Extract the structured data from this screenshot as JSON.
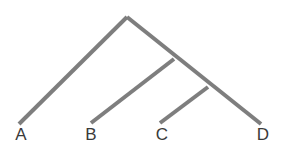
{
  "figure": {
    "kind": "cladogram",
    "title": "",
    "background_color": "#ffffff",
    "branch_color": "#7e7e7e",
    "branch_width": 4,
    "label_color": "#3a3a3a"
  },
  "chart_data": {
    "type": "diagram",
    "subtype": "cladogram",
    "title": "",
    "xlabel": "",
    "ylabel": "",
    "taxa": [
      "A",
      "B",
      "C",
      "D"
    ],
    "topology": "(A,(B,(C,D)))",
    "nodes": [
      {
        "id": "root",
        "label": "",
        "x": 127,
        "y": 17
      },
      {
        "id": "node1",
        "label": "",
        "x": 146,
        "y": 34
      },
      {
        "id": "node2",
        "label": "",
        "x": 174,
        "y": 59
      },
      {
        "id": "node3",
        "label": "",
        "x": 208,
        "y": 87
      }
    ],
    "tips": [
      {
        "id": "A",
        "label": "A",
        "x": 19,
        "y": 124,
        "label_x": 21,
        "label_y": 140
      },
      {
        "id": "B",
        "label": "B",
        "x": 91,
        "y": 123,
        "label_x": 91,
        "label_y": 140
      },
      {
        "id": "C",
        "label": "C",
        "x": 160,
        "y": 123,
        "label_x": 162,
        "label_y": 140
      },
      {
        "id": "D",
        "label": "D",
        "x": 261,
        "y": 124,
        "label_x": 263,
        "label_y": 140
      }
    ],
    "edges": [
      {
        "id": "edge-root-to-a",
        "from": "root",
        "to": "A",
        "x1": 127,
        "y1": 17,
        "x2": 19,
        "y2": 124
      },
      {
        "id": "edge-root-spine-to-d",
        "from": "root",
        "to": "D",
        "x1": 127,
        "y1": 17,
        "x2": 261,
        "y2": 124
      },
      {
        "id": "edge-node1-to-b",
        "from": "node1",
        "to": "B",
        "x1": 174,
        "y1": 59,
        "x2": 91,
        "y2": 123
      },
      {
        "id": "edge-node2-to-c",
        "from": "node2",
        "to": "C",
        "x1": 208,
        "y1": 87,
        "x2": 160,
        "y2": 123
      }
    ]
  },
  "labels": {
    "a": "A",
    "b": "B",
    "c": "C",
    "d": "D"
  }
}
